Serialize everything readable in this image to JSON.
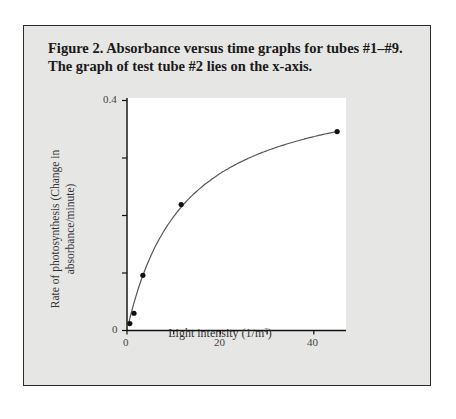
{
  "figure": {
    "title_line1": "Figure 2. Absorbance versus time graphs for tubes #1–#9.",
    "title_line2": "The graph of test tube #2 lies on the x-axis."
  },
  "axes": {
    "ylabel_line1": "Rate of photosynthesis (Change in",
    "ylabel_line2": "absorbance/minute)",
    "xlabel_text": "Light intensity (1/m",
    "xlabel_sup": "2",
    "xlabel_close": ")",
    "y_tick_labels": [
      "0.4",
      "0"
    ],
    "x_tick_labels": [
      "0",
      "20",
      "40"
    ]
  },
  "colors": {
    "frame_bg": "#e6e6e4",
    "plot_bg": "#ffffff",
    "line": "#555555",
    "marker": "#111111",
    "border": "#2a2a2a"
  },
  "chart_data": {
    "type": "scatter",
    "title": "Figure 2. Absorbance versus time graphs for tubes #1–#9. The graph of test tube #2 lies on the x-axis.",
    "xlabel": "Light intensity (1/m²)",
    "ylabel": "Rate of photosynthesis (Change in absorbance/minute)",
    "xlim": [
      0,
      47
    ],
    "ylim": [
      0,
      0.4
    ],
    "x_ticks": [
      0,
      10,
      20,
      30,
      40
    ],
    "x_tick_labels": [
      "0",
      "",
      "20",
      "",
      "40"
    ],
    "y_ticks": [
      0,
      0.1,
      0.2,
      0.3,
      0.4
    ],
    "y_tick_labels": [
      "0",
      "",
      "",
      "",
      "0.4"
    ],
    "grid": false,
    "legend": null,
    "series": [
      {
        "name": "measured",
        "x": [
          0.6,
          1.5,
          3.4,
          11.6,
          45
        ],
        "y": [
          0.012,
          0.03,
          0.096,
          0.219,
          0.346
        ],
        "marker": "circle",
        "fit_curve": "smooth saturating curve through points"
      }
    ]
  }
}
